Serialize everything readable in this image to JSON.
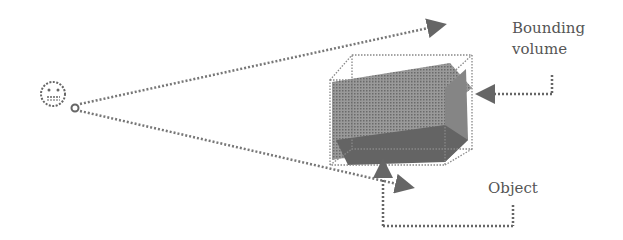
{
  "diagram": {
    "labels": {
      "bounding_volume_line1": "Bounding",
      "bounding_volume_line2": "volume",
      "object": "Object"
    },
    "icons": {
      "viewer": "neutral-face-icon"
    },
    "colors": {
      "object_fill": "#8a8a8a",
      "object_dark": "#5e5e5e",
      "line": "#777777"
    }
  }
}
